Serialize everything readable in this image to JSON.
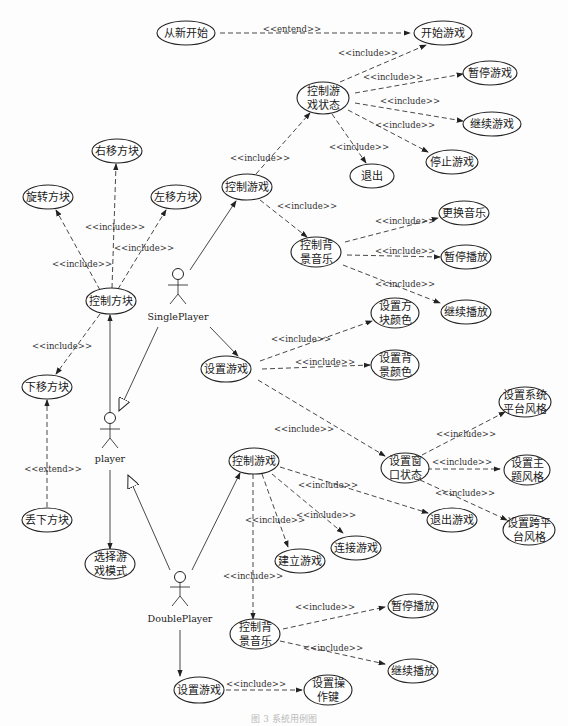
{
  "diagram": {
    "type": "uml-use-case",
    "actors": {
      "player": "player",
      "single": "SinglePlayer",
      "double": "DoublePlayer"
    },
    "use_cases": {
      "restart": [
        "从新开始"
      ],
      "start_game": [
        "开始游戏"
      ],
      "ctrl_game_state": [
        "控制游",
        "戏状态"
      ],
      "pause_game": [
        "暂停游戏"
      ],
      "resume_game": [
        "继续游戏"
      ],
      "stop_game": [
        "停止游戏"
      ],
      "exit": [
        "退出"
      ],
      "single_ctrl_game": [
        "控制游戏"
      ],
      "single_ctrl_music": [
        "控制背",
        "景音乐"
      ],
      "change_music": [
        "更换音乐"
      ],
      "single_pause_play": [
        "暂停播放"
      ],
      "single_resume_play": [
        "继续播放"
      ],
      "move_right": [
        "右移方块"
      ],
      "rotate": [
        "旋转方块"
      ],
      "move_left": [
        "左移方块"
      ],
      "ctrl_block": [
        "控制方块"
      ],
      "move_down": [
        "下移方块"
      ],
      "drop_block": [
        "丢下方块"
      ],
      "select_mode": [
        "选择游",
        "戏模式"
      ],
      "single_settings": [
        "设置游戏"
      ],
      "block_color": [
        "设置方",
        "块颜色"
      ],
      "bg_color": [
        "设置背",
        "景颜色"
      ],
      "window_state": [
        "设置窗",
        "口状态"
      ],
      "sys_style": [
        "设置系统",
        "平台风格"
      ],
      "theme_style": [
        "设置主",
        "题风格"
      ],
      "cross_style": [
        "设置跨平",
        "台风格"
      ],
      "double_ctrl_game": [
        "控制游戏"
      ],
      "exit_game": [
        "退出游戏"
      ],
      "connect_game": [
        "连接游戏"
      ],
      "create_game": [
        "建立游戏"
      ],
      "double_ctrl_music": [
        "控制背",
        "景音乐"
      ],
      "double_pause_play": [
        "暂停播放"
      ],
      "double_resume_play": [
        "继续播放"
      ],
      "double_settings": [
        "设置游戏"
      ],
      "key_settings": [
        "设置操",
        "作键"
      ]
    },
    "stereotypes": {
      "include": "<<include>>",
      "extend": "<<extend>>",
      "entend": "<<entend>>"
    },
    "caption": "图 3  系统用例图"
  }
}
